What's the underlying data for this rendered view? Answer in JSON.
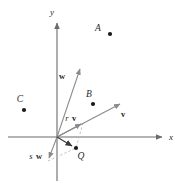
{
  "figure": {
    "background_color": "#ffffff",
    "axis_color": "#6b6b6b",
    "vector_color": "#8a8a8a",
    "dashed_color": "#b0b0b0",
    "point_color": "#1a1a1a",
    "width": 183,
    "height": 186
  },
  "axes": {
    "x_label": "x",
    "y_label": "y",
    "origin": {
      "x": 57,
      "y": 137
    },
    "x_axis": {
      "x1": 8,
      "y1": 137,
      "x2": 167,
      "y2": 137
    },
    "y_axis": {
      "x1": 57,
      "y1": 18,
      "x2": 57,
      "y2": 181
    },
    "x_label_pos": {
      "x": 171,
      "y": 140
    },
    "y_label_pos": {
      "x": 52,
      "y": 15
    }
  },
  "points": [
    {
      "name": "A",
      "label": "A",
      "label_x": 98,
      "label_y": 31,
      "dot_x": 110,
      "dot_y": 34
    },
    {
      "name": "B",
      "label": "B",
      "label_x": 89,
      "label_y": 97,
      "dot_x": 93,
      "dot_y": 104
    },
    {
      "name": "C",
      "label": "C",
      "label_x": 20,
      "label_y": 102,
      "dot_x": 24,
      "dot_y": 110
    },
    {
      "name": "Q",
      "label": "Q",
      "label_x": 78,
      "label_y": 158,
      "dot_x": 76,
      "dot_y": 148
    }
  ],
  "vectors": [
    {
      "name": "w",
      "label": "w",
      "scalar_prefix": "",
      "label_x": 62,
      "label_y": 78,
      "from": {
        "x": 57,
        "y": 137
      },
      "to": {
        "x": 79,
        "y": 68
      }
    },
    {
      "name": "v",
      "label": "v",
      "scalar_prefix": "",
      "label_x": 122,
      "label_y": 116,
      "from": {
        "x": 57,
        "y": 137
      },
      "to": {
        "x": 122,
        "y": 103
      }
    },
    {
      "name": "rv",
      "label": "v",
      "scalar_prefix": "r",
      "label_x": 68,
      "label_y": 121,
      "from": {
        "x": 57,
        "y": 137
      },
      "to": {
        "x": 83,
        "y": 123
      }
    },
    {
      "name": "sw",
      "label": "w",
      "scalar_prefix": "s",
      "label_x": 30,
      "label_y": 158,
      "from": {
        "x": 57,
        "y": 137
      },
      "to": {
        "x": 48,
        "y": 161
      }
    },
    {
      "name": "OQ",
      "label": "",
      "scalar_prefix": "",
      "label_x": 0,
      "label_y": 0,
      "from": {
        "x": 57,
        "y": 137
      },
      "to": {
        "x": 74,
        "y": 147
      }
    }
  ],
  "dashed_lines": [
    {
      "name": "rv-to-Q",
      "x1": 83,
      "y1": 123,
      "x2": 76,
      "y2": 148
    },
    {
      "name": "sw-to-Q",
      "x1": 48,
      "y1": 161,
      "x2": 76,
      "y2": 148
    }
  ]
}
